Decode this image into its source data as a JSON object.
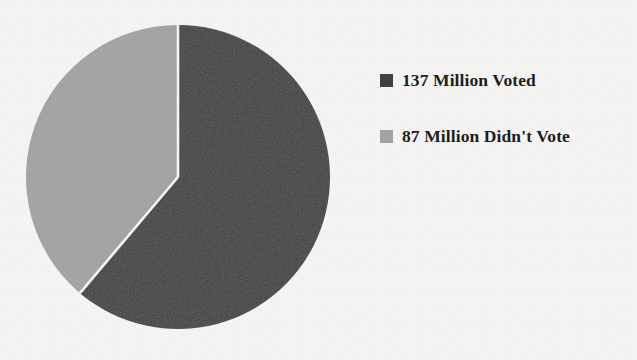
{
  "chart_data": {
    "type": "pie",
    "title": "",
    "subtitle": "",
    "xlabel": "",
    "ylabel": "",
    "grid": false,
    "legend_position": "right",
    "start_angle_deg": 0,
    "direction": "clockwise",
    "unit": "million people",
    "total": 224,
    "categories": [
      "137 Million Voted",
      "87 Million Didn't Vote"
    ],
    "values": [
      137,
      87
    ],
    "percentages": [
      61.2,
      38.8
    ],
    "slices": [
      {
        "label": "137 Million Voted",
        "value": 137,
        "unit_label": "Million",
        "percent": 61.2,
        "angle_deg": 220.2,
        "color": "#404040"
      },
      {
        "label": "87 Million Didn't Vote",
        "value": 87,
        "unit_label": "Million",
        "percent": 38.8,
        "angle_deg": 139.8,
        "color": "#a2a2a2"
      }
    ],
    "annotations": []
  },
  "legend": {
    "items": [
      {
        "label": "137 Million Voted",
        "color": "#404040",
        "swatch_name": "legend-swatch-voted"
      },
      {
        "label": "87 Million Didn't Vote",
        "color": "#a2a2a2",
        "swatch_name": "legend-swatch-didnt-vote"
      }
    ]
  },
  "colors": {
    "background": "#f4f3f1",
    "slice_dark": "#404040",
    "slice_light": "#a2a2a2",
    "separator": "#f6f5f3",
    "text": "#1d1d1d"
  },
  "geometry": {
    "center_x": 153,
    "center_y": 153,
    "radius": 152
  }
}
